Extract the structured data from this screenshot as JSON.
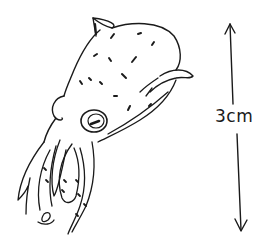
{
  "figure": {
    "scale_bar": {
      "label": "3cm",
      "orientation": "vertical",
      "arrowheads": "both ends"
    }
  },
  "colors": {
    "ink": "#1a1a1a",
    "background": "#ffffff"
  }
}
